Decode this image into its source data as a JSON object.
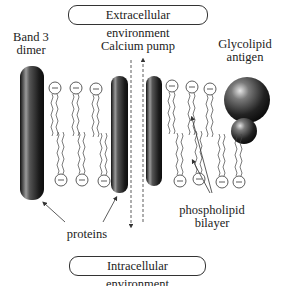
{
  "diagram": {
    "environments": {
      "top": "Extracellular environment",
      "bottom": "Intracellular environment"
    },
    "labels": {
      "band3_line1": "Band 3",
      "band3_line2": "dimer",
      "calcium_pump": "Calcium pump",
      "glycolipid_line1": "Glycolipid",
      "glycolipid_line2": "antigen",
      "proteins": "proteins",
      "phospholipid_line1": "phospholipid",
      "phospholipid_line2": "bilayer"
    },
    "head_symbol": "−",
    "colors": {
      "protein_dark": "#1a1a1a",
      "protein_highlight": "#bdbdbd",
      "line": "#333333",
      "background": "#ffffff"
    }
  }
}
